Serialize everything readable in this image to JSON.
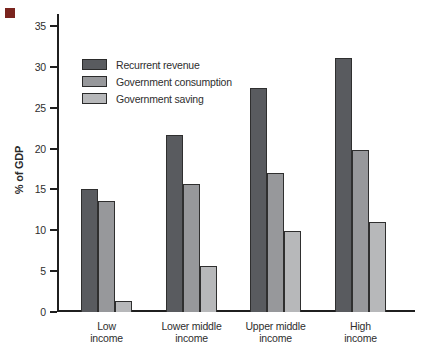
{
  "figure": {
    "corner_marker_color": "#7a241e",
    "axis_color": "#1f1f1f",
    "text_color": "#2e2e2e",
    "background_color": "#ffffff"
  },
  "chart_data": {
    "type": "bar",
    "title": "",
    "xlabel": "",
    "ylabel": "% of GDP",
    "ylim": [
      0,
      35
    ],
    "yticks": [
      0,
      5,
      10,
      15,
      20,
      25,
      30,
      35
    ],
    "grid": false,
    "legend_position": "upper-left-inside",
    "categories": [
      {
        "line1": "Low",
        "line2": "income"
      },
      {
        "line1": "Lower middle",
        "line2": "income"
      },
      {
        "line1": "Upper middle",
        "line2": "income"
      },
      {
        "line1": "High",
        "line2": "income"
      }
    ],
    "series": [
      {
        "name": "Recurrent revenue",
        "color": "#595b5f",
        "values": [
          15.1,
          21.6,
          27.4,
          31.1
        ]
      },
      {
        "name": "Government consumption",
        "color": "#97989b",
        "values": [
          13.6,
          15.7,
          17.0,
          19.8
        ]
      },
      {
        "name": "Government saving",
        "color": "#b7b8ba",
        "values": [
          1.3,
          5.6,
          9.9,
          11.0
        ]
      }
    ]
  }
}
